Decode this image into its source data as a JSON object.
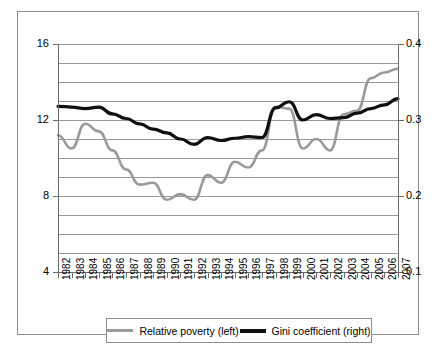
{
  "chart_data": {
    "type": "line",
    "title": "",
    "subtitle": "",
    "xlabel": "",
    "ylabel": "",
    "grid": true,
    "legend_position": "bottom",
    "x": [
      1982,
      1983,
      1984,
      1985,
      1986,
      1987,
      1988,
      1989,
      1990,
      1991,
      1992,
      1993,
      1994,
      1995,
      1996,
      1997,
      1998,
      1999,
      2000,
      2001,
      2002,
      2003,
      2004,
      2005,
      2006,
      2007
    ],
    "categories": [
      "1982",
      "1983",
      "1984",
      "1985",
      "1986",
      "1987",
      "1988",
      "1989",
      "1990",
      "1991",
      "1992",
      "1993",
      "1994",
      "1995",
      "1996",
      "1997",
      "1998",
      "1999",
      "2000",
      "2001",
      "2002",
      "2003",
      "2004",
      "2005",
      "2006",
      "2007"
    ],
    "axes": {
      "left": {
        "label": "",
        "min": 4,
        "max": 16,
        "tick_labels": [
          "4",
          "8",
          "12",
          "16"
        ],
        "tick_values": [
          4,
          8,
          12,
          16
        ],
        "gridline_values": [
          4,
          5,
          6,
          7,
          8,
          9,
          10,
          11,
          12,
          13,
          14,
          15,
          16
        ],
        "step": 1
      },
      "right": {
        "label": "",
        "min": 0.1,
        "max": 0.4,
        "tick_labels": [
          "0.1",
          "0.2",
          "0.3",
          "0.4"
        ],
        "tick_values": [
          0.1,
          0.2,
          0.3,
          0.4
        ],
        "step": 0.1
      }
    },
    "series": [
      {
        "name": "Relative poverty (left)",
        "axis": "left",
        "color": "#9a9a9a",
        "width": 2.6,
        "values": [
          11.2,
          10.5,
          11.8,
          11.4,
          10.4,
          9.4,
          8.6,
          8.7,
          7.8,
          8.1,
          7.8,
          9.1,
          8.7,
          9.8,
          9.5,
          10.4,
          12.7,
          12.6,
          10.5,
          11.0,
          10.4,
          12.3,
          12.5,
          14.2,
          14.5,
          14.7
        ]
      },
      {
        "name": "Gini coefficient (right)",
        "axis": "right",
        "color": "#101010",
        "width": 3.2,
        "values": [
          0.318,
          0.317,
          0.315,
          0.317,
          0.308,
          0.302,
          0.295,
          0.288,
          0.283,
          0.275,
          0.268,
          0.277,
          0.273,
          0.276,
          0.278,
          0.277,
          0.316,
          0.324,
          0.3,
          0.307,
          0.302,
          0.303,
          0.309,
          0.315,
          0.32,
          0.328
        ]
      }
    ]
  },
  "legend": {
    "items": [
      {
        "label": "Relative poverty (left)",
        "color": "#9a9a9a"
      },
      {
        "label": "Gini coefficient (right)",
        "color": "#101010"
      }
    ]
  },
  "colors": {
    "poverty_line": "#9a9a9a",
    "gini_line": "#101010",
    "gridline": "#999999",
    "axis": "#6b6b6b",
    "frame": "#8c8c8c",
    "background": "#ffffff"
  }
}
